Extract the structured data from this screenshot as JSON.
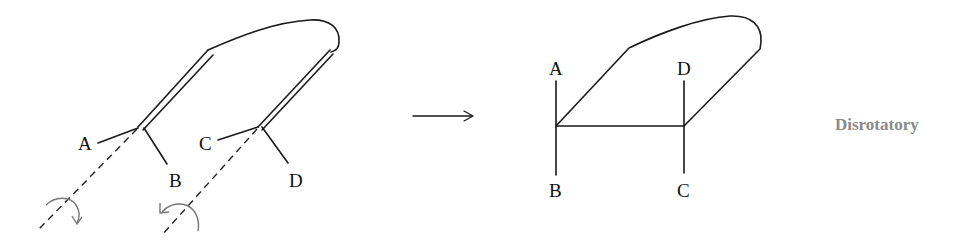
{
  "diagram": {
    "type": "electrocyclic-ring-closure",
    "reactant": {
      "substituent_labels": {
        "a": "A",
        "b": "B",
        "c": "C",
        "d": "D"
      },
      "rotation_left": "clockwise",
      "rotation_right": "counterclockwise"
    },
    "reaction_arrow": "→",
    "product": {
      "substituent_labels": {
        "a": "A",
        "b": "B",
        "c": "C",
        "d": "D"
      }
    },
    "caption": "Disrotatory",
    "colors": {
      "line": "#1a1a1a",
      "rotation_arrow": "#777777",
      "caption": "#8a8a8a"
    }
  }
}
